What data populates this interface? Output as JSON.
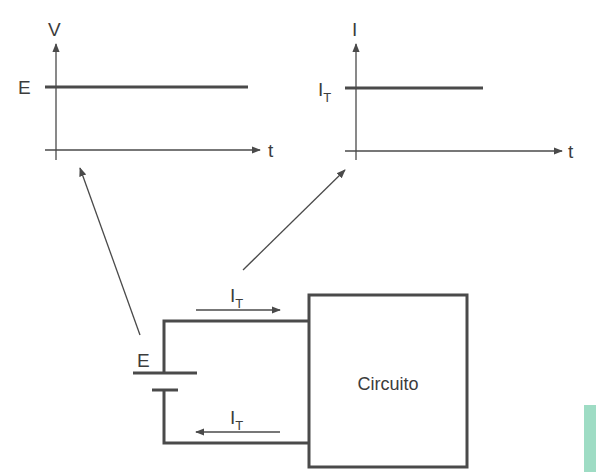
{
  "voltage_graph": {
    "y_axis_label": "V",
    "x_axis_label": "t",
    "level_label": "E",
    "description": "constant voltage E over time"
  },
  "current_graph": {
    "y_axis_label": "I",
    "x_axis_label": "t",
    "level_label_main": "I",
    "level_label_sub": "T",
    "description": "constant current I_T over time"
  },
  "circuit": {
    "source_label": "E",
    "block_label": "Circuito",
    "current_top_main": "I",
    "current_top_sub": "T",
    "current_bottom_main": "I",
    "current_bottom_sub": "T"
  },
  "colors": {
    "stroke": "#4a4a4a",
    "text": "#3c3c3c",
    "swatch": "#9edcc4"
  }
}
